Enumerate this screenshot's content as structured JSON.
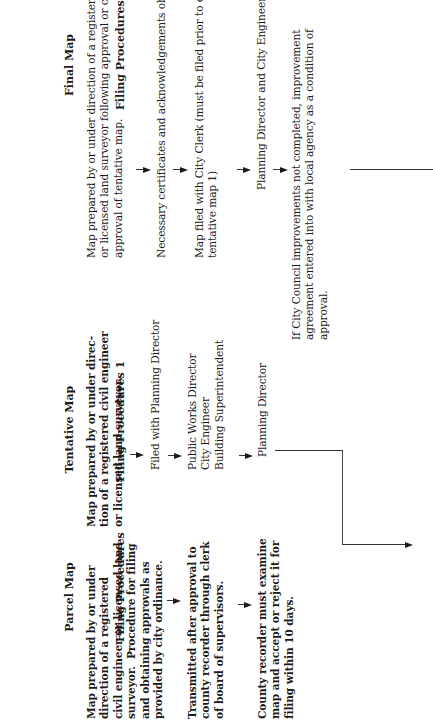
{
  "orientation": "rotated 90 degrees counter-clockwise",
  "columns": {
    "parcel": {
      "title": "Parcel Map",
      "subtitle": "Filing Procedures",
      "steps": [
        "Map prepared by or under\ndirection of a registered\ncivil engineer or licensed land\nsurveyor.  Procedure for filing\nand obtaining approvals as\nprovided by city ordinance.",
        "Transmitted after approval to\ncounty recorder through clerk\nof board of supervisors.",
        "County recorder must examine\nmap and accept or reject it for\nfiling within 10 days."
      ]
    },
    "tentative": {
      "title": "Tentative Map",
      "subtitle": "Filing Procedures 1",
      "steps": [
        "Map prepared by or under direc-\ntion of a registered civil engineer\nor licensed land surveyor.",
        "Filed with Planning Director",
        "Public Works Director\nCity Engineer\nBuilding Superintendent",
        "Planning Director"
      ]
    },
    "final": {
      "title": "Final Map",
      "subtitle": "Filing Procedures",
      "steps": [
        "Map prepared by or under direction of a registered civil engineer\nor licensed land surveyor following approval or conditional\napproval of tentative map.",
        "Necessary certificates and acknowledgements obtained.",
        "Map filed with City Clerk (must be filed prior to expiration of\ntentative map 1)",
        "Planning Director and City Engineer",
        "If City Council improvements not completed, improvement\nagreement entered into with local agency as a condition of\napproval."
      ]
    }
  },
  "colors": {
    "text": "#1a1a1a",
    "lines": "#444444",
    "background": "#ffffff"
  }
}
